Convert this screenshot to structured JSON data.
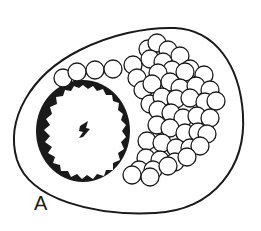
{
  "figure": {
    "panel_label": "A",
    "colors": {
      "stroke": "#1a1a1a",
      "fill": "#ffffff",
      "background": "#ffffff"
    }
  },
  "elements": {
    "cell_membrane": {
      "cx": 130,
      "cy": 122,
      "shape": "rounded-oval"
    },
    "nucleus": {
      "cx": 83,
      "cy": 131,
      "rx": 46,
      "ry": 50
    },
    "nucleolus": {
      "cx": 84,
      "cy": 130
    },
    "vesicles": [
      [
        63,
        78,
        9
      ],
      [
        77,
        72,
        9
      ],
      [
        95,
        70,
        9
      ],
      [
        113,
        69,
        9
      ],
      [
        133,
        65,
        9
      ],
      [
        137,
        78,
        9
      ],
      [
        143,
        90,
        9
      ],
      [
        150,
        104,
        9
      ],
      [
        148,
        49,
        9
      ],
      [
        157,
        43,
        9
      ],
      [
        168,
        50,
        9
      ],
      [
        180,
        56,
        9
      ],
      [
        190,
        69,
        9
      ],
      [
        204,
        75,
        9
      ],
      [
        150,
        59,
        9
      ],
      [
        163,
        62,
        9
      ],
      [
        172,
        70,
        9
      ],
      [
        185,
        72,
        9
      ],
      [
        158,
        73,
        9
      ],
      [
        170,
        82,
        9
      ],
      [
        180,
        88,
        9
      ],
      [
        196,
        86,
        9
      ],
      [
        210,
        90,
        9
      ],
      [
        152,
        84,
        9
      ],
      [
        162,
        97,
        9
      ],
      [
        176,
        99,
        9
      ],
      [
        190,
        98,
        9
      ],
      [
        205,
        102,
        9
      ],
      [
        216,
        101,
        9
      ],
      [
        158,
        110,
        9
      ],
      [
        171,
        113,
        9
      ],
      [
        183,
        118,
        9
      ],
      [
        197,
        116,
        9
      ],
      [
        210,
        118,
        9
      ],
      [
        157,
        125,
        9
      ],
      [
        170,
        128,
        9
      ],
      [
        185,
        133,
        9
      ],
      [
        198,
        132,
        9
      ],
      [
        207,
        134,
        9
      ],
      [
        147,
        141,
        9
      ],
      [
        162,
        143,
        9
      ],
      [
        176,
        148,
        9
      ],
      [
        190,
        148,
        9
      ],
      [
        200,
        146,
        9
      ],
      [
        146,
        158,
        9
      ],
      [
        160,
        160,
        9
      ],
      [
        175,
        162,
        9
      ],
      [
        187,
        157,
        9
      ],
      [
        139,
        170,
        9
      ],
      [
        153,
        170,
        9
      ],
      [
        168,
        166,
        9
      ],
      [
        132,
        175,
        9
      ],
      [
        150,
        177,
        9
      ]
    ]
  }
}
